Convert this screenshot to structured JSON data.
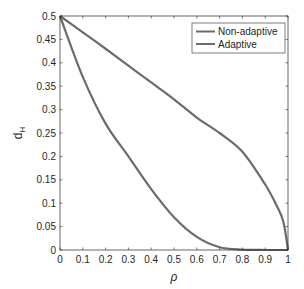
{
  "chart_data": {
    "type": "line",
    "title": "",
    "xlabel": "ρ",
    "ylabel": "d",
    "ylabel_subscript": "H",
    "xlim": [
      0,
      1
    ],
    "ylim": [
      0,
      0.5
    ],
    "grid": false,
    "legend_position": "upper right",
    "x_ticks": [
      "0",
      "0.1",
      "0.2",
      "0.3",
      "0.4",
      "0.5",
      "0.6",
      "0.7",
      "0.8",
      "0.9",
      "1"
    ],
    "y_ticks": [
      "0",
      "0.05",
      "0.1",
      "0.15",
      "0.2",
      "0.25",
      "0.3",
      "0.35",
      "0.4",
      "0.45",
      "0.5"
    ],
    "x": [
      0,
      0.1,
      0.2,
      0.3,
      0.4,
      0.5,
      0.6,
      0.7,
      0.8,
      0.9,
      0.95,
      0.98,
      1.0
    ],
    "series": [
      {
        "name": "Non-adaptive",
        "color": "#6b6b6b",
        "values": [
          0.5,
          0.465,
          0.43,
          0.394,
          0.358,
          0.322,
          0.283,
          0.25,
          0.21,
          0.14,
          0.095,
          0.06,
          0.0
        ]
      },
      {
        "name": "Adaptive",
        "color": "#6b6b6b",
        "values": [
          0.5,
          0.37,
          0.27,
          0.2,
          0.13,
          0.07,
          0.028,
          0.006,
          0.001,
          0.0,
          0.0,
          0.0,
          0.0
        ]
      }
    ]
  }
}
